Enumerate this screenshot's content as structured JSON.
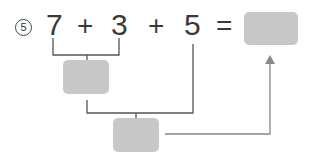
{
  "problem": {
    "number": "5",
    "terms": [
      "7",
      "3",
      "5"
    ],
    "operators": [
      "+",
      "+"
    ],
    "equals": "="
  },
  "boxes": {
    "result": "",
    "first_sum": "",
    "second_sum": ""
  },
  "colors": {
    "box_fill": "#c8c8c8",
    "bracket_line": "#555555",
    "arrow_line": "#888888",
    "text": "#3a3a3a"
  }
}
